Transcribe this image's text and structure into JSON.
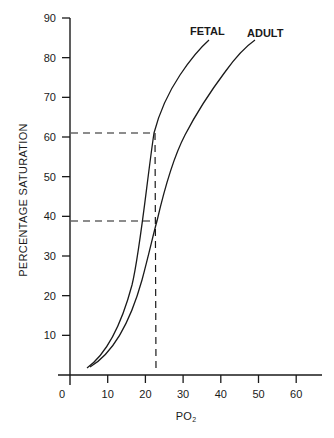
{
  "chart_data": {
    "type": "line",
    "title": "",
    "xlabel": "PO₂",
    "ylabel": "PERCENTAGE SATURATION",
    "xlim": [
      0,
      65
    ],
    "ylim": [
      0,
      90
    ],
    "x_ticks": [
      0,
      10,
      20,
      30,
      40,
      50,
      60
    ],
    "y_ticks": [
      10,
      20,
      30,
      40,
      50,
      60,
      70,
      80,
      90
    ],
    "grid": false,
    "legend": "inline curve labels",
    "series": [
      {
        "name": "FETAL",
        "x": [
          5,
          8,
          11,
          14,
          17,
          20,
          22.5,
          26,
          30,
          34,
          37
        ],
        "y": [
          1,
          4,
          10,
          18,
          30,
          45,
          60,
          70,
          78,
          83,
          86
        ]
      },
      {
        "name": "ADULT",
        "x": [
          6,
          10,
          14,
          18,
          22.5,
          26,
          30,
          35,
          40,
          45,
          50
        ],
        "y": [
          1,
          5,
          12,
          22,
          38,
          50,
          61,
          70,
          77,
          82,
          85
        ]
      }
    ],
    "annotations": [
      {
        "type": "dashed-vertical",
        "x": 22.5,
        "y_from": 0,
        "y_to": 60
      },
      {
        "type": "dashed-horizontal",
        "y": 60,
        "x_from": 0,
        "x_to": 22.5,
        "note": "fetal saturation at PO2 22.5"
      },
      {
        "type": "dashed-horizontal",
        "y": 38,
        "x_from": 0,
        "x_to": 22.5,
        "note": "adult saturation at PO2 22.5"
      }
    ]
  },
  "labels": {
    "xlabel_main": "PO",
    "xlabel_sub": "2",
    "ylabel": "PERCENTAGE SATURATION",
    "fetal": "FETAL",
    "adult": "ADULT",
    "x_ticks": [
      "0",
      "10",
      "20",
      "30",
      "40",
      "50",
      "60"
    ],
    "y_ticks": [
      "90",
      "80",
      "70",
      "60",
      "50",
      "40",
      "30",
      "20",
      "10"
    ]
  }
}
